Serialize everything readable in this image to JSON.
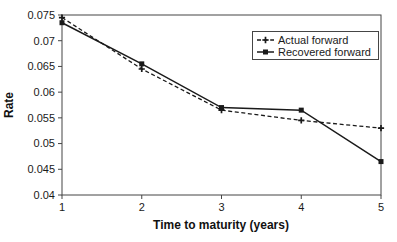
{
  "figure": {
    "width": 397,
    "height": 242,
    "background": "#ffffff",
    "ink_color": "#1a1a1a",
    "frame_color": "#454545"
  },
  "chart_data": {
    "type": "line",
    "title": "",
    "xlabel": "Time to maturity (years)",
    "ylabel": "Rate",
    "xlim": [
      1,
      5
    ],
    "ylim": [
      0.04,
      0.075
    ],
    "grid": false,
    "legend_position": "top-right-inside",
    "x": [
      1,
      2,
      3,
      4,
      5
    ],
    "x_tick_labels": [
      "1",
      "2",
      "3",
      "4",
      "5"
    ],
    "y_ticks": [
      0.075,
      0.07,
      0.065,
      0.06,
      0.055,
      0.05,
      0.045,
      0.04
    ],
    "y_tick_labels": [
      "0.075",
      "0.07",
      "0.065",
      "0.06",
      "0.055",
      "0.05",
      "0.045",
      "0.04"
    ],
    "series": [
      {
        "name": "Actual forward",
        "line_style": "dashed",
        "marker": "plus",
        "color": "#1a1a1a",
        "values": [
          0.0745,
          0.0645,
          0.0565,
          0.0545,
          0.053
        ]
      },
      {
        "name": "Recovered forward",
        "line_style": "solid",
        "marker": "square",
        "color": "#1a1a1a",
        "values": [
          0.0735,
          0.0655,
          0.057,
          0.0565,
          0.0465
        ]
      }
    ]
  }
}
